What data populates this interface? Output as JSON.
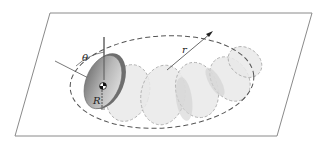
{
  "figure": {
    "labels": {
      "theta": "θ",
      "r": "r",
      "R": "R"
    },
    "colors": {
      "plane_edge": "#8a8a8a",
      "dashed_path": "#555555",
      "ghost_disk_fill": "#e6e6e6",
      "ghost_disk_stroke": "#b5b5b5",
      "disk_fill": "#9a9a9a",
      "disk_rim": "#6e6e6e"
    }
  }
}
